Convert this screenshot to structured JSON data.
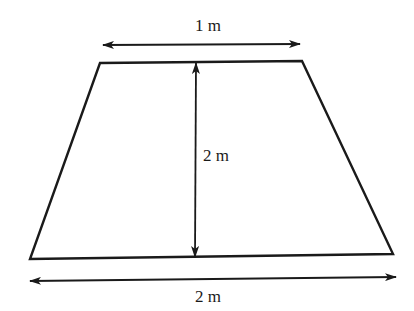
{
  "diagram": {
    "type": "trapezoid",
    "stroke_color": "#1a1a1a",
    "background": "#ffffff",
    "labels": {
      "top_width": "1 m",
      "height": "2 m",
      "bottom_width": "2 m"
    },
    "vertices": {
      "top_left": [
        100,
        63
      ],
      "top_right": [
        302,
        61
      ],
      "bottom_right": [
        393,
        254
      ],
      "bottom_left": [
        30,
        259
      ]
    },
    "dimensions": {
      "top": {
        "x1": 103,
        "y1": 45,
        "x2": 300,
        "y2": 44,
        "label_x": 208,
        "label_y": 31
      },
      "height": {
        "x1": 196,
        "y1": 63,
        "x2": 195,
        "y2": 257,
        "label_x": 203,
        "label_y": 161
      },
      "bottom": {
        "x1": 30,
        "y1": 281,
        "x2": 396,
        "y2": 277,
        "label_x": 208,
        "label_y": 302
      }
    }
  }
}
